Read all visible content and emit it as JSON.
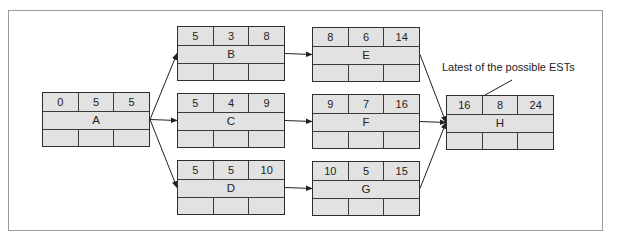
{
  "diagram": {
    "type": "activity-on-node network",
    "annotation": "Latest of the possible ESTs",
    "nodes": [
      {
        "id": "A",
        "est": "0",
        "duration": "5",
        "eft": "5"
      },
      {
        "id": "B",
        "est": "5",
        "duration": "3",
        "eft": "8"
      },
      {
        "id": "C",
        "est": "5",
        "duration": "4",
        "eft": "9"
      },
      {
        "id": "D",
        "est": "5",
        "duration": "5",
        "eft": "10"
      },
      {
        "id": "E",
        "est": "8",
        "duration": "6",
        "eft": "14"
      },
      {
        "id": "F",
        "est": "9",
        "duration": "7",
        "eft": "16"
      },
      {
        "id": "G",
        "est": "10",
        "duration": "5",
        "eft": "15"
      },
      {
        "id": "H",
        "est": "16",
        "duration": "8",
        "eft": "24"
      }
    ],
    "edges": [
      {
        "from": "A",
        "to": "B"
      },
      {
        "from": "A",
        "to": "C"
      },
      {
        "from": "A",
        "to": "D"
      },
      {
        "from": "B",
        "to": "E"
      },
      {
        "from": "C",
        "to": "F"
      },
      {
        "from": "D",
        "to": "G"
      },
      {
        "from": "E",
        "to": "H"
      },
      {
        "from": "F",
        "to": "H"
      },
      {
        "from": "G",
        "to": "H"
      }
    ]
  }
}
